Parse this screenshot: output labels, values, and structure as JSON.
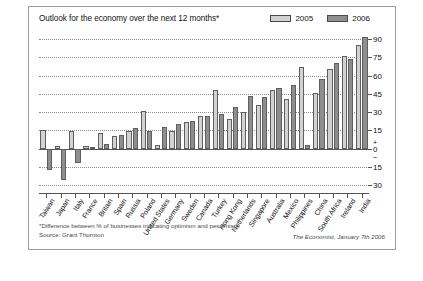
{
  "chart_data": {
    "type": "bar",
    "title": "Outlook for the economy over the next 12 months*",
    "xlabel": "",
    "ylabel": "",
    "ylim": [
      -30,
      95
    ],
    "grid": true,
    "legend_position": "top-right",
    "yticks": [
      90,
      75,
      60,
      45,
      30,
      15,
      0,
      -15,
      -30
    ],
    "ytick_labels": [
      "90",
      "75",
      "60",
      "45",
      "30",
      "15",
      "0",
      "15",
      "30"
    ],
    "zero_sign_plus": "+",
    "zero_sign_minus": "–",
    "categories": [
      "Taiwan",
      "Japan",
      "Italy",
      "France",
      "Britain",
      "Spain",
      "Russia",
      "Poland",
      "United States",
      "Germany",
      "Sweden",
      "Canada",
      "Turkey",
      "Hong Kong",
      "Netherlands",
      "Singapore",
      "Australia",
      "Mexico",
      "Philippines",
      "China",
      "South Africa",
      "Ireland",
      "India"
    ],
    "series": [
      {
        "name": "2005",
        "color": "#d2d2d2",
        "values": [
          15,
          2,
          14,
          2,
          13,
          10,
          14,
          31,
          3,
          14,
          22,
          27,
          48,
          24,
          30,
          36,
          48,
          41,
          67,
          46,
          65,
          76,
          85
        ]
      },
      {
        "name": "2006",
        "color": "#8e8e8e",
        "values": [
          -18,
          -26,
          -12,
          1,
          4,
          11,
          17,
          14,
          18,
          20,
          23,
          27,
          28,
          34,
          43,
          42,
          50,
          52,
          3,
          57,
          70,
          74,
          92
        ]
      }
    ]
  },
  "legend": {
    "items": [
      {
        "label": "2005",
        "color": "#d2d2d2"
      },
      {
        "label": "2006",
        "color": "#8e8e8e"
      }
    ]
  },
  "footer": {
    "footnote_line1": "*Difference between % of businesses indicating optimism and pessimism.",
    "footnote_line2": "Source: Grant Thornton",
    "source_right": "The Economist, January 7th 2006"
  }
}
